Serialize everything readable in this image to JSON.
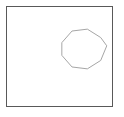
{
  "canvas": {
    "width": 124,
    "height": 117,
    "background_color": "#fefefe",
    "outside_background_color": "#ffffff"
  },
  "frame": {
    "name": "drawing-canvas-frame",
    "shape": "rectangle",
    "x": 6.5,
    "y": 6.5,
    "width": 106,
    "height": 100,
    "stroke_color": "#595959",
    "stroke_width": 1.6,
    "fill_color": "#ffffff"
  },
  "shapes": [
    {
      "name": "polygon-circle",
      "shape": "polygon",
      "sides": 10,
      "center_x": 84,
      "center_y": 49,
      "radius": 23,
      "rotation_degrees": -8,
      "stroke_color": "#a6a6a6",
      "stroke_width": 1,
      "fill_color": "none",
      "points": "106.76,45.80 100.71,60.46 87.36,68.85 72.00,66.98 61.83,55.34 61.83,42.66 72.00,31.02 87.36,29.15 100.71,37.54 106.76,45.80"
    }
  ]
}
